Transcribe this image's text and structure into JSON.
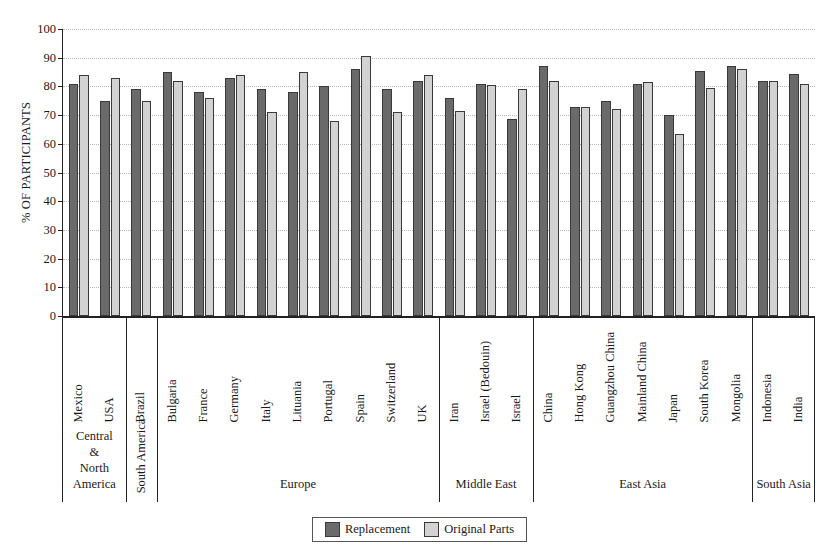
{
  "chart_data": {
    "type": "bar",
    "title": "",
    "subtitle": "",
    "xlabel": "",
    "ylabel": "% OF PARTICIPANTS",
    "ylim": [
      0,
      100
    ],
    "ytick_step": 10,
    "yticks": [
      "0",
      "10",
      "20",
      "30",
      "40",
      "50",
      "60",
      "70",
      "80",
      "90",
      "100"
    ],
    "grid": true,
    "legend_position": "bottom-center",
    "categories": [
      "Mexico",
      "USA",
      "Brazil",
      "Bulgaria",
      "France",
      "Germany",
      "Italy",
      "Lituania",
      "Portugal",
      "Spain",
      "Switzerland",
      "UK",
      "Iran",
      "Israel (Bedouin)",
      "Israel",
      "China",
      "Hong Kong",
      "Guangzhou China",
      "Mainland China",
      "Japan",
      "South Korea",
      "Mongolia",
      "Indonesia",
      "India"
    ],
    "series": [
      {
        "name": "Replacement",
        "color": "#6a6a6a",
        "values": [
          81,
          75,
          79,
          85,
          78,
          83,
          79,
          78,
          80,
          86,
          79,
          82,
          76,
          81,
          68.5,
          87,
          73,
          75,
          81,
          70,
          85.5,
          87,
          82,
          84.5
        ]
      },
      {
        "name": "Original Parts",
        "color": "#d2d2d2",
        "values": [
          84,
          83,
          75,
          82,
          76,
          84,
          71,
          85,
          68,
          90.5,
          71,
          84,
          71.5,
          80.5,
          79,
          82,
          73,
          72,
          81.5,
          63.5,
          79.5,
          86,
          82,
          81
        ]
      }
    ],
    "region_groups": [
      {
        "label": "Central\n&\nNorth\nAmerica",
        "label_text": "Central & North America",
        "orientation": "horizontal",
        "categories": [
          "Mexico",
          "USA"
        ]
      },
      {
        "label": "South America",
        "label_text": "South America",
        "orientation": "vertical",
        "categories": [
          "Brazil"
        ]
      },
      {
        "label": "Europe",
        "label_text": "Europe",
        "orientation": "horizontal",
        "categories": [
          "Bulgaria",
          "France",
          "Germany",
          "Italy",
          "Lituania",
          "Portugal",
          "Spain",
          "Switzerland",
          "UK"
        ]
      },
      {
        "label": "Middle East",
        "label_text": "Middle East",
        "orientation": "horizontal",
        "categories": [
          "Iran",
          "Israel (Bedouin)",
          "Israel"
        ]
      },
      {
        "label": "East Asia",
        "label_text": "East Asia",
        "orientation": "horizontal",
        "categories": [
          "China",
          "Hong Kong",
          "Guangzhou China",
          "Mainland China",
          "Japan",
          "South Korea",
          "Mongolia"
        ]
      },
      {
        "label": "South Asia",
        "label_text": "South Asia",
        "orientation": "horizontal",
        "categories": [
          "Indonesia",
          "India"
        ]
      }
    ]
  },
  "legend": {
    "items": [
      {
        "label": "Replacement",
        "swatch": "replacement"
      },
      {
        "label": "Original Parts",
        "swatch": "original"
      }
    ]
  },
  "region_lines": {
    "central_north_america": [
      "Central",
      "&",
      "North",
      "America"
    ],
    "south_america": "South America",
    "europe": [
      "Europe"
    ],
    "middle_east": [
      "Middle East"
    ],
    "east_asia": [
      "East Asia"
    ],
    "south_asia": [
      "South",
      "Asia"
    ]
  }
}
